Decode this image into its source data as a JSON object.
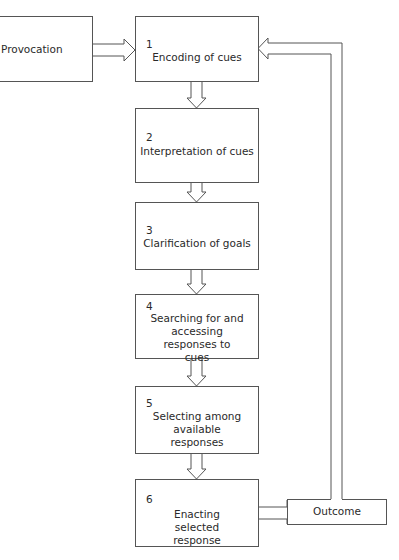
{
  "diagram": {
    "type": "flowchart",
    "line_color": "#555555",
    "provocation": {
      "label": "Provocation"
    },
    "outcome": {
      "label": "Outcome"
    },
    "steps": [
      {
        "number": "1",
        "label": "Encoding of cues"
      },
      {
        "number": "2",
        "label": "Interpretation of cues"
      },
      {
        "number": "3",
        "label": "Clarification of goals"
      },
      {
        "number": "4",
        "label": "Searching for and accessing responses to cues"
      },
      {
        "number": "5",
        "label": "Selecting among available responses"
      },
      {
        "number": "6",
        "label": "Enacting selected response"
      }
    ],
    "connections": [
      {
        "from": "Provocation",
        "to": "1"
      },
      {
        "from": "1",
        "to": "2"
      },
      {
        "from": "2",
        "to": "3"
      },
      {
        "from": "3",
        "to": "4"
      },
      {
        "from": "4",
        "to": "5"
      },
      {
        "from": "5",
        "to": "6"
      },
      {
        "from": "6",
        "to": "Outcome"
      },
      {
        "from": "Outcome",
        "to": "1"
      }
    ]
  }
}
